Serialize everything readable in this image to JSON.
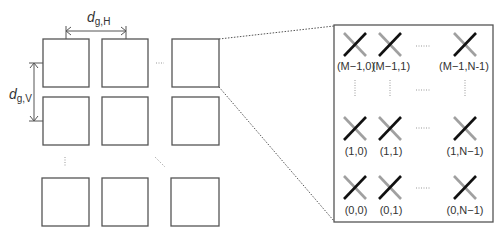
{
  "diagram": {
    "spacing_labels": {
      "horizontal": {
        "main": "d",
        "sub": "g,H"
      },
      "vertical": {
        "main": "d",
        "sub": "g,V"
      }
    },
    "grid": {
      "rows": 3,
      "cols": 3,
      "ellipsis_horizontal": "······",
      "ellipsis_vertical": "⋮",
      "ellipsis_diagonal": "⋱"
    },
    "zoom_panel": {
      "rows": [
        {
          "labels": [
            "(M−1,0)",
            "(M−1,1)",
            "(M−1,N-1)"
          ]
        },
        {
          "labels": [
            "(1,0)",
            "(1,1)",
            "(1,N−1)"
          ]
        },
        {
          "labels": [
            "(0,0)",
            "(0,1)",
            "(0,N−1)"
          ]
        }
      ]
    },
    "colors": {
      "outline": "#555555",
      "cross_gray": "#a0a0a0",
      "cross_black": "#111111",
      "text": "#333333"
    }
  }
}
